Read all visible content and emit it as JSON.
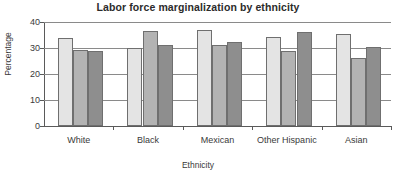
{
  "chart_data": {
    "type": "bar",
    "title": "Labor force marginalization by ethnicity",
    "xlabel": "Ethnicity",
    "ylabel": "Percentage",
    "categories": [
      "White",
      "Black",
      "Mexican",
      "Other Hispanic",
      "Asian"
    ],
    "ytick_labels": [
      "0",
      "10",
      "20",
      "30",
      "40"
    ],
    "yticks": [
      0,
      10,
      20,
      30,
      40
    ],
    "ylim": [
      0,
      40
    ],
    "grid": true,
    "grid_axis": "y",
    "legend": "none",
    "series": [
      {
        "name": "series-1",
        "color": "#e4e4e4",
        "values": [
          33.7,
          30.0,
          37.0,
          34.1,
          35.5
        ]
      },
      {
        "name": "series-2",
        "color": "#b3b3b3",
        "values": [
          29.1,
          36.5,
          31.1,
          28.8,
          26.2
        ]
      },
      {
        "name": "series-3",
        "color": "#8e8e8e",
        "values": [
          29.0,
          31.2,
          32.5,
          36.2,
          30.3
        ]
      }
    ]
  }
}
